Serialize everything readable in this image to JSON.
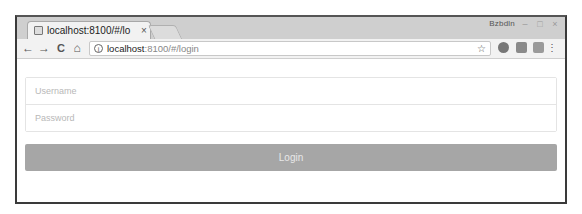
{
  "browser": {
    "tab": {
      "title": "localhost:8100/#/lo",
      "close": "×"
    },
    "profile_label": "Bzbdln",
    "window_controls": {
      "minimize": "–",
      "maximize": "□",
      "close": "×"
    },
    "nav": {
      "back": "←",
      "forward": "→",
      "reload": "C",
      "home": "⌂"
    },
    "address": {
      "info_icon": "i",
      "host": "localhost",
      "rest": ":8100/#/login",
      "star": "☆"
    },
    "menu_icon": "⋮"
  },
  "form": {
    "username": {
      "placeholder": "Username",
      "value": ""
    },
    "password": {
      "placeholder": "Password",
      "value": ""
    },
    "login_label": "Login"
  },
  "colors": {
    "button_bg": "#a6a6a6",
    "tab_bar": "#cfcfcf"
  }
}
